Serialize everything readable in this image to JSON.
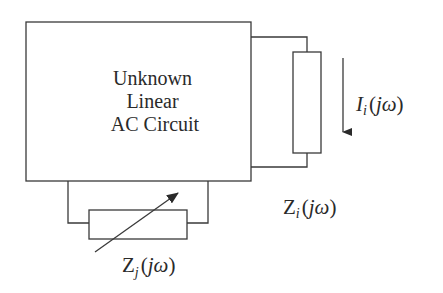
{
  "diagram": {
    "type": "circuit",
    "main_block": {
      "lines": [
        "Unknown",
        "Linear",
        "AC Circuit"
      ]
    },
    "impedance_i": {
      "symbol": "Z",
      "subscript": "i",
      "argument_open": "(",
      "argument_var": "jω",
      "argument_close": ")"
    },
    "current_i": {
      "symbol": "I",
      "subscript": "i",
      "argument_open": "(",
      "argument_var": "jω",
      "argument_close": ")",
      "direction": "down"
    },
    "impedance_j": {
      "symbol": "Z",
      "subscript": "j",
      "argument_open": "(",
      "argument_var": "jω",
      "argument_close": ")",
      "variable": true
    },
    "colors": {
      "line": "#3a3a3a",
      "text": "#2a2a2a",
      "background": "#ffffff"
    }
  }
}
